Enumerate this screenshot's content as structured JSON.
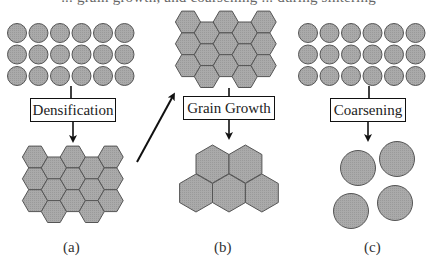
{
  "figure": {
    "caption_fragment": "... grain growth, and coarsening ... during sintering",
    "colors": {
      "grain_fill": "#a9a9a9",
      "grain_stroke": "#555555",
      "line": "#111111",
      "background": "#ffffff"
    },
    "panels": [
      {
        "id": "a",
        "label": "(a)",
        "process": "Densification",
        "initial_state": {
          "shape": "circle",
          "rows": 3,
          "cols": 6
        },
        "final_state": {
          "shape": "hexagon",
          "arrangement": "dense honeycomb, 5 columns alternating 3/2 offset rows",
          "count": 14
        }
      },
      {
        "id": "b",
        "label": "(b)",
        "process": "Grain Growth",
        "initial_state": {
          "shape": "hexagon",
          "arrangement": "dense honeycomb",
          "count": 14
        },
        "final_state": {
          "shape": "hexagon",
          "arrangement": "2 over 3 large grains",
          "count": 5
        }
      },
      {
        "id": "c",
        "label": "(c)",
        "process": "Coarsening",
        "initial_state": {
          "shape": "circle",
          "rows": 3,
          "cols": 6
        },
        "final_state": {
          "shape": "circle",
          "arrangement": "2x2 large particles",
          "count": 4
        }
      }
    ],
    "connector": {
      "from": "a.final_state",
      "to": "b.initial_state",
      "style": "diagonal arrow"
    }
  }
}
